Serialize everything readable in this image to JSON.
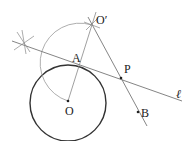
{
  "diagram": {
    "title": "",
    "points": [
      {
        "id": "O_prime",
        "label": "O′",
        "x": 92,
        "y": 25
      },
      {
        "id": "A",
        "label": "A",
        "x": 78,
        "y": 65
      },
      {
        "id": "O",
        "label": "O",
        "x": 68,
        "y": 101
      },
      {
        "id": "P",
        "label": "P",
        "x": 121,
        "y": 78
      },
      {
        "id": "B",
        "label": "B",
        "x": 138,
        "y": 112
      }
    ],
    "line_label": "ℓ",
    "labels": {
      "o_prime": "O′",
      "a": "A",
      "o": "O",
      "p": "P",
      "b": "B",
      "ell": "ℓ"
    },
    "colors": {
      "circle": "#333333",
      "construction": "#888888",
      "line": "#777777",
      "text": "#222222"
    }
  }
}
